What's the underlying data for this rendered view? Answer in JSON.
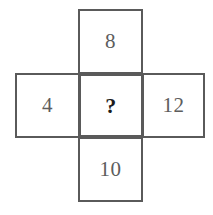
{
  "figure": {
    "shape": "cross",
    "border_color": "#5a5a5a",
    "background_color": "#ffffff",
    "numeral_color": "#5d5d5d",
    "unknown_color": "#1c1c1c",
    "cells": {
      "top": {
        "label": "8",
        "position": "top"
      },
      "left": {
        "label": "4",
        "position": "left"
      },
      "center": {
        "label": "?",
        "position": "center"
      },
      "right": {
        "label": "12",
        "position": "right"
      },
      "bottom": {
        "label": "10",
        "position": "bottom"
      }
    }
  }
}
